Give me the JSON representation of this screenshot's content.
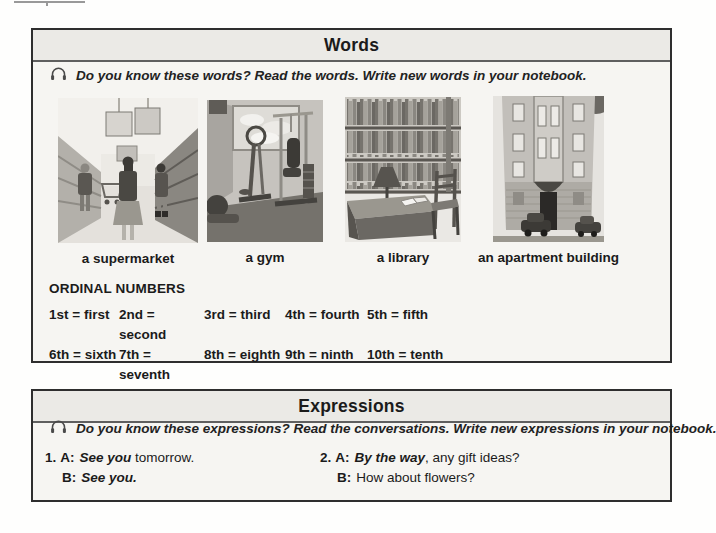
{
  "colors": {
    "box_border": "#2e2e2e",
    "text": "#1b1b1b",
    "box_background": "#f6f5f2"
  },
  "words_section": {
    "title": "Words",
    "audio_icon": "headphones-icon",
    "instruction": "Do you know these words? Read the words. Write new words in your notebook.",
    "items": [
      {
        "caption": "a supermarket",
        "image": "supermarket-illustration"
      },
      {
        "caption": "a gym",
        "image": "gym-photo"
      },
      {
        "caption": "a library",
        "image": "library-illustration"
      },
      {
        "caption": "an apartment building",
        "image": "apartment-building-photo"
      }
    ],
    "ordinal_numbers": {
      "heading": "ORDINAL NUMBERS",
      "rows": [
        [
          "1st = first",
          "2nd = second",
          "3rd = third",
          "4th = fourth",
          "5th = fifth"
        ],
        [
          "6th = sixth",
          "7th = seventh",
          "8th = eighth",
          "9th = ninth",
          "10th = tenth"
        ]
      ]
    }
  },
  "expressions_section": {
    "title": "Expressions",
    "audio_icon": "headphones-icon",
    "instruction": "Do you know these expressions? Read the conversations. Write new expressions in your notebook.",
    "dialogues": [
      {
        "number": "1.",
        "a_label": "A:",
        "a_highlight": "See you",
        "a_rest": " tomorrow.",
        "b_label": "B:",
        "b_highlight": "See you.",
        "b_rest": ""
      },
      {
        "number": "2.",
        "a_label": "A:",
        "a_highlight": "By the way",
        "a_rest": ", any gift ideas?",
        "b_label": "B:",
        "b_highlight": "",
        "b_rest": "How about flowers?"
      }
    ]
  }
}
